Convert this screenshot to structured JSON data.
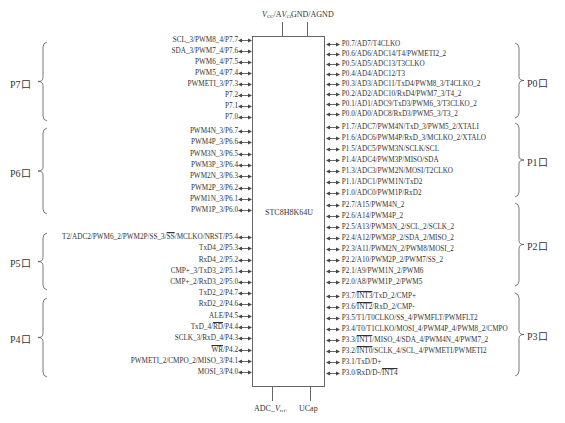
{
  "chip": {
    "label": "STC8H8K64U",
    "top_pins": [
      {
        "label": "VCC/AVCC",
        "x": 282
      },
      {
        "label": "GND/AGND",
        "x": 307
      }
    ],
    "bottom_pins": [
      {
        "label": "ADC_Vref+",
        "x": 272
      },
      {
        "label": "UCap",
        "x": 310
      }
    ]
  },
  "left_groups": [
    {
      "port": "P7口",
      "pins": [
        "SCL_3/PWM8_4/P7.7",
        "SDA_3/PWM7_4/P7.6",
        "PWM6_4/P7.5",
        "PWM5_4/P7.4",
        "PWMETI_3/P7.3",
        "P7.2",
        "P7.1",
        "P7.0"
      ]
    },
    {
      "port": "P6口",
      "pins": [
        "PWM4N_3/P6.7",
        "PWM4P_3/P6.6",
        "PWM3N_3/P6.5",
        "PWM3P_3/P6.4",
        "PWM2N_3/P6.3",
        "PWM2P_3/P6.2",
        "PWM1N_3/P6.1",
        "PWM1P_3/P6.0"
      ]
    },
    {
      "port": "P5口",
      "pins": [
        "T2/ADC2/PWM6_2/PWM2P/SS_3/SS/MCLKO/NRST/P5.4",
        "TxD4_2/P5.3",
        "RxD4_2/P5.2",
        "CMP+_3/TxD3_2/P5.1",
        "CMP+_2/RxD3_2/P5.0"
      ]
    },
    {
      "port": "P4口",
      "pins": [
        "TxD2_2/P4.7",
        "RxD2_2/P4.6",
        "ALE/P4.5",
        "TxD_4/RD/P4.4",
        "SCLK_3/RxD_4/P4.3",
        "WR/P4.2",
        "PWMETI_2/CMPO_2/MISO_3/P4.1",
        "MOSI_3/P4.0"
      ]
    }
  ],
  "right_groups": [
    {
      "port": "P0口",
      "pins": [
        "P0.7/AD7/T4CLKO",
        "P0.6/AD6/ADC14/T4/PWMETI2_2",
        "P0.5/AD5/ADC13/T3CLKO",
        "P0.4/AD4/ADC12/T3",
        "P0.3/AD3/ADC11/TxD4/PWM8_3/T4CLKO_2",
        "P0.2/AD2/ADC10/RxD4/PWM7_3/T4_2",
        "P0.1/AD1/ADC9/TxD3/PWM6_3/T3CLKO_2",
        "P0.0/AD0/ADC8/RxD3/PWM5_3/T3_2"
      ]
    },
    {
      "port": "P1口",
      "pins": [
        "P1.7/ADC7/PWM4N/TxD_3/PWM5_2/XTALI",
        "P1.6/ADC6/PWM4P/RxD_3/MCLKO_2/XTALO",
        "P1.5/ADC5/PWM3N/SCLK/SCL",
        "P1.4/ADC4/PWM3P/MISO/SDA",
        "P1.3/ADC3/PWM2N/MOSI/T2CLKO",
        "P1.1/ADC1/PWM1N/TxD2",
        "P1.0/ADC0/PWM1P/RxD2"
      ]
    },
    {
      "port": "P2口",
      "pins": [
        "P2.7/A15/PWM4N_2",
        "P2.6/A14/PWM4P_2",
        "P2.5/A13/PWM3N_2/SCL_2/SCLK_2",
        "P2.4/A12/PWM3P_2/SDA_2/MISO_2",
        "P2.3/A11/PWM2N_2/PWM8/MOSI_2",
        "P2.2/A10/PWM2P_2/PWM7/SS_2",
        "P2.1/A9/PWM1N_2/PWM6",
        "P2.0/A8/PWM1P_2/PWM5"
      ]
    },
    {
      "port": "P3口",
      "pins": [
        "P3.7/INT3/TxD_2/CMP+",
        "P3.6/INT2/RxD_2/CMP-",
        "P3.5/T1/T0CLKO/SS_4/PWMFLT/PWMFLT2",
        "P3.4/T0/T1CLKO/MOSI_4/PWM4P_4/PWM8_2/CMPO",
        "P3.3/INT1/MISO_4/SDA_4/PWM4N_4/PWM7_2",
        "P3.2/INT0/SCLK_4/SCL_4/PWMETI/PWMETI2",
        "P3.1/TxD/D+",
        "P3.0/RxD/D-/INT4"
      ]
    }
  ],
  "colors": {
    "line": "#666666",
    "text": "#333333",
    "background": "#ffffff"
  }
}
